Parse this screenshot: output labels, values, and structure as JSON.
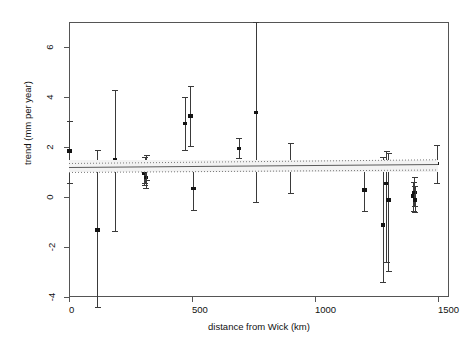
{
  "figure": {
    "title": "",
    "xlabel": "distance from Wick (km)",
    "ylabel": "trend (mm per year)"
  },
  "axes": {
    "x_ticks": [
      "0",
      "500",
      "1000",
      "1500"
    ],
    "y_ticks": [
      "6",
      "4",
      "2",
      "0",
      "-2",
      "-4"
    ]
  },
  "chart_data": {
    "type": "scatter",
    "title": "",
    "xlabel": "distance from Wick (km)",
    "ylabel": "trend (mm per year)",
    "xlim": [
      -60,
      1570
    ],
    "ylim": [
      -4.6,
      7.0
    ],
    "grid": false,
    "legend": null,
    "x_tick_values": [
      0,
      500,
      1000,
      1500
    ],
    "y_tick_values": [
      -4,
      -2,
      0,
      2,
      4,
      6
    ],
    "error_bar_style": "vertical with caps, 95% interval",
    "points": [
      {
        "x": 0,
        "y": 1.85,
        "lo": 0.55,
        "hi": 3.05
      },
      {
        "x": 115,
        "y": -1.3,
        "lo": -4.4,
        "hi": 1.9
      },
      {
        "x": 185,
        "y": 1.5,
        "lo": -1.35,
        "hi": 4.3
      },
      {
        "x": 305,
        "y": 0.95,
        "lo": 0.5,
        "hi": 1.45
      },
      {
        "x": 308,
        "y": 1.05,
        "lo": 0.55,
        "hi": 1.6
      },
      {
        "x": 312,
        "y": 0.8,
        "lo": 0.35,
        "hi": 1.3
      },
      {
        "x": 315,
        "y": 1.2,
        "lo": 0.7,
        "hi": 1.7
      },
      {
        "x": 470,
        "y": 2.95,
        "lo": 1.9,
        "hi": 4.0
      },
      {
        "x": 492,
        "y": 3.25,
        "lo": 2.05,
        "hi": 4.45
      },
      {
        "x": 505,
        "y": 0.35,
        "lo": -0.5,
        "hi": 1.2
      },
      {
        "x": 690,
        "y": 1.95,
        "lo": 1.55,
        "hi": 2.35
      },
      {
        "x": 760,
        "y": 3.4,
        "lo": -0.2,
        "hi": 7.0
      },
      {
        "x": 900,
        "y": 1.15,
        "lo": 0.15,
        "hi": 2.15
      },
      {
        "x": 1200,
        "y": 0.3,
        "lo": -0.55,
        "hi": 1.35
      },
      {
        "x": 1275,
        "y": -1.1,
        "lo": -3.4,
        "hi": 1.6
      },
      {
        "x": 1290,
        "y": 0.55,
        "lo": -2.6,
        "hi": 1.85
      },
      {
        "x": 1297,
        "y": -0.1,
        "lo": -2.95,
        "hi": 1.75
      },
      {
        "x": 1400,
        "y": 0.05,
        "lo": -0.55,
        "hi": 0.6
      },
      {
        "x": 1403,
        "y": 0.2,
        "lo": -0.35,
        "hi": 0.8
      },
      {
        "x": 1406,
        "y": -0.1,
        "lo": -0.6,
        "hi": 0.45
      },
      {
        "x": 1495,
        "y": 1.35,
        "lo": 0.55,
        "hi": 2.1
      }
    ],
    "fit_line": {
      "style": "solid",
      "x0": 0,
      "y0": 1.2,
      "x1": 1500,
      "y1": 1.32
    },
    "confidence_band": {
      "style": "dotted",
      "upper_y0": 1.35,
      "upper_y1": 1.5,
      "lower_y0": 1.0,
      "lower_y1": 1.1
    }
  },
  "colors": {
    "axis": "#555555",
    "point": "#141414",
    "fit": "#5a5a5a",
    "band": "#7a7a7a"
  }
}
